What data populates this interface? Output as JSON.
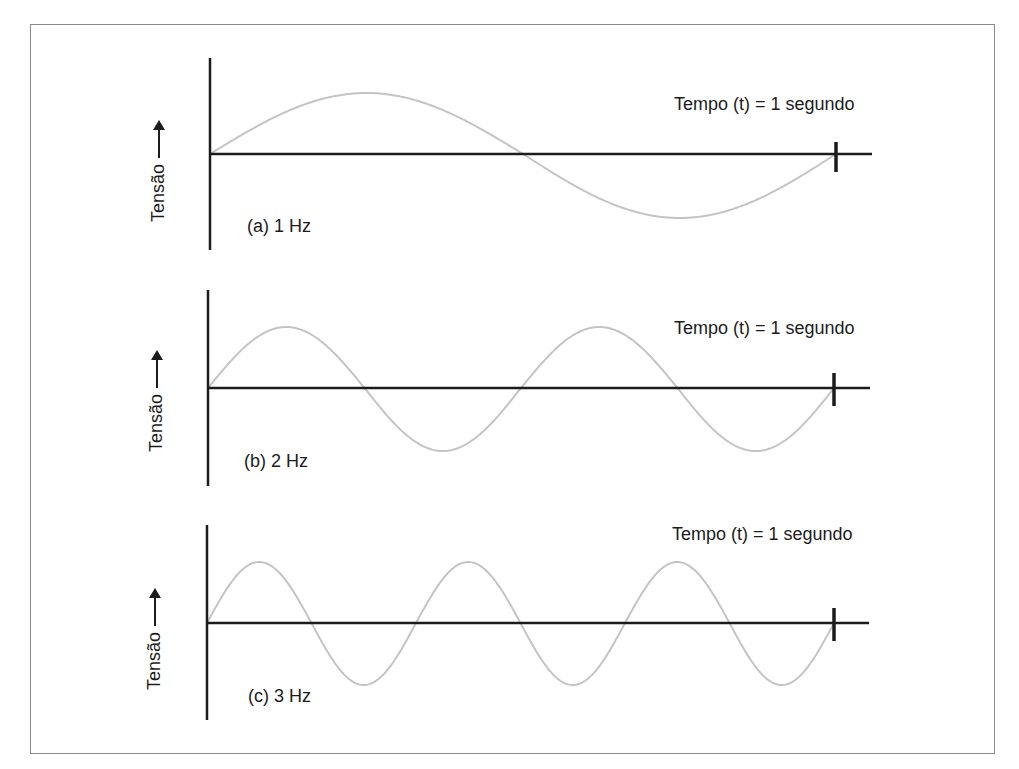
{
  "figure": {
    "border_color": "#8a8a8a",
    "axis_color": "#1c1c1c",
    "wave_color": "#c4c4c4"
  },
  "panels": [
    {
      "id": "a",
      "caption": "(a) 1 Hz",
      "y_axis_label": "Tensão",
      "time_label": "Tempo (t) = 1 segundo",
      "frequency_hz": 1,
      "geometry": {
        "vaxis_x": 210,
        "vaxis_top": 58,
        "vaxis_bottom": 250,
        "baseline_y": 154,
        "haxis_end_x": 872,
        "tick_x": 836,
        "tick_top": 142,
        "tick_bottom": 172,
        "amplitude_up": 61,
        "amplitude_down": 64,
        "caption_x": 247,
        "caption_y": 216,
        "time_x": 674,
        "time_y": 94,
        "ylabel_x": 148,
        "ylabel_y": 222
      }
    },
    {
      "id": "b",
      "caption": "(b) 2 Hz",
      "y_axis_label": "Tensão",
      "time_label": "Tempo (t) = 1 segundo",
      "frequency_hz": 2,
      "geometry": {
        "vaxis_x": 208,
        "vaxis_top": 290,
        "vaxis_bottom": 486,
        "baseline_y": 388,
        "haxis_end_x": 870,
        "tick_x": 834,
        "tick_top": 373,
        "tick_bottom": 406,
        "amplitude_up": 61,
        "amplitude_down": 63,
        "caption_x": 244,
        "caption_y": 451,
        "time_x": 674,
        "time_y": 318,
        "ylabel_x": 146,
        "ylabel_y": 452
      }
    },
    {
      "id": "c",
      "caption": "(c) 3 Hz",
      "y_axis_label": "Tensão",
      "time_label": "Tempo (t) = 1 segundo",
      "frequency_hz": 3,
      "geometry": {
        "vaxis_x": 207,
        "vaxis_top": 525,
        "vaxis_bottom": 720,
        "baseline_y": 623,
        "haxis_end_x": 869,
        "tick_x": 834,
        "tick_top": 608,
        "tick_bottom": 641,
        "amplitude_up": 61,
        "amplitude_down": 62,
        "caption_x": 248,
        "caption_y": 686,
        "time_x": 672,
        "time_y": 524,
        "ylabel_x": 144,
        "ylabel_y": 690
      }
    }
  ],
  "chart_data": [
    {
      "type": "line",
      "title": "(a) 1 Hz",
      "xlabel": "Tempo (t) = 1 segundo",
      "ylabel": "Tensão",
      "frequency_hz": 1,
      "cycles": 1,
      "x": [
        0,
        0.25,
        0.5,
        0.75,
        1.0
      ],
      "values": [
        0,
        1,
        0,
        -1,
        0
      ],
      "xlim": [
        0,
        1
      ],
      "ylim": [
        -1,
        1
      ],
      "grid": false
    },
    {
      "type": "line",
      "title": "(b) 2 Hz",
      "xlabel": "Tempo (t) = 1 segundo",
      "ylabel": "Tensão",
      "frequency_hz": 2,
      "cycles": 2,
      "x": [
        0,
        0.125,
        0.25,
        0.375,
        0.5,
        0.625,
        0.75,
        0.875,
        1.0
      ],
      "values": [
        0,
        1,
        0,
        -1,
        0,
        1,
        0,
        -1,
        0
      ],
      "xlim": [
        0,
        1
      ],
      "ylim": [
        -1,
        1
      ],
      "grid": false
    },
    {
      "type": "line",
      "title": "(c) 3 Hz",
      "xlabel": "Tempo (t) = 1 segundo",
      "ylabel": "Tensão",
      "frequency_hz": 3,
      "cycles": 3,
      "x": [
        0,
        0.0833,
        0.1667,
        0.25,
        0.3333,
        0.4167,
        0.5,
        0.5833,
        0.6667,
        0.75,
        0.8333,
        0.9167,
        1.0
      ],
      "values": [
        0,
        1,
        0,
        -1,
        0,
        1,
        0,
        -1,
        0,
        1,
        0,
        -1,
        0
      ],
      "xlim": [
        0,
        1
      ],
      "ylim": [
        -1,
        1
      ],
      "grid": false
    }
  ]
}
